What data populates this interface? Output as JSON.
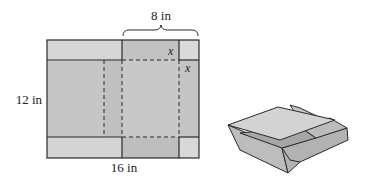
{
  "figure": {
    "net": {
      "width_label": "16 in",
      "height_label": "12 in",
      "top_brace_label": "8 in",
      "corner_label_top": "x",
      "corner_label_side": "x"
    },
    "colors": {
      "flap_light": "#d6d6d6",
      "panel_mid": "#c4c4c4",
      "panel_dark": "#bdbdbd",
      "line": "#2a2a2a",
      "box_top": "#cfcfcf",
      "box_side": "#b5b5b5",
      "box_inner": "#a8a8a8"
    }
  }
}
